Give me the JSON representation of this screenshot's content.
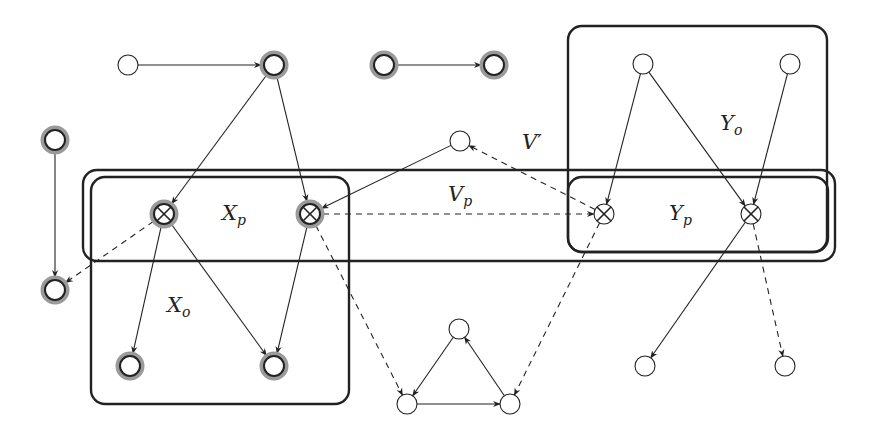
{
  "diagram": {
    "type": "directed-graph",
    "colors": {
      "stroke": "#222222",
      "halo": "#9a9a9a",
      "background": "#ffffff"
    },
    "labels": {
      "Xp": {
        "base": "X",
        "sub": "p"
      },
      "Xo": {
        "base": "X",
        "sub": "o"
      },
      "Vp": {
        "base": "V",
        "sub": "p"
      },
      "Vprime": {
        "base": "V",
        "sup": "′"
      },
      "Yo": {
        "base": "Y",
        "sub": "o"
      },
      "Yp": {
        "base": "Y",
        "sub": "p"
      }
    },
    "regions": [
      {
        "id": "V-prime-band",
        "label": "V'"
      },
      {
        "id": "Xp-box",
        "label": "Xp"
      },
      {
        "id": "Xo-box",
        "label": "Xo"
      },
      {
        "id": "Yo-box",
        "label": "Yo"
      },
      {
        "id": "Yp-box",
        "label": "Yp"
      }
    ],
    "nodes": [
      {
        "id": "n1",
        "x": 128,
        "y": 65,
        "style": "plain"
      },
      {
        "id": "n2",
        "x": 274,
        "y": 65,
        "style": "halo"
      },
      {
        "id": "n3",
        "x": 384,
        "y": 65,
        "style": "halo"
      },
      {
        "id": "n4",
        "x": 494,
        "y": 65,
        "style": "halo"
      },
      {
        "id": "n5",
        "x": 55,
        "y": 140,
        "style": "halo"
      },
      {
        "id": "n6",
        "x": 55,
        "y": 290,
        "style": "halo"
      },
      {
        "id": "xp1",
        "x": 164,
        "y": 214,
        "style": "halo-cross"
      },
      {
        "id": "xp2",
        "x": 310,
        "y": 214,
        "style": "halo-cross"
      },
      {
        "id": "xo1",
        "x": 130,
        "y": 366,
        "style": "halo"
      },
      {
        "id": "xo2",
        "x": 274,
        "y": 366,
        "style": "halo"
      },
      {
        "id": "v1",
        "x": 460,
        "y": 141,
        "style": "plain"
      },
      {
        "id": "yo1",
        "x": 643,
        "y": 64,
        "style": "plain"
      },
      {
        "id": "yo2",
        "x": 790,
        "y": 64,
        "style": "plain"
      },
      {
        "id": "yp1",
        "x": 604,
        "y": 214,
        "style": "cross"
      },
      {
        "id": "yp2",
        "x": 751,
        "y": 214,
        "style": "cross"
      },
      {
        "id": "t1",
        "x": 459,
        "y": 329,
        "style": "plain"
      },
      {
        "id": "t2",
        "x": 407,
        "y": 404,
        "style": "plain"
      },
      {
        "id": "t3",
        "x": 510,
        "y": 404,
        "style": "plain"
      },
      {
        "id": "b1",
        "x": 645,
        "y": 366,
        "style": "plain"
      },
      {
        "id": "b2",
        "x": 785,
        "y": 366,
        "style": "plain"
      }
    ],
    "edges": [
      {
        "from": "n1",
        "to": "n2",
        "style": "solid"
      },
      {
        "from": "n3",
        "to": "n4",
        "style": "solid"
      },
      {
        "from": "n2",
        "to": "xp1",
        "style": "solid"
      },
      {
        "from": "n2",
        "to": "xp2",
        "style": "solid"
      },
      {
        "from": "n5",
        "to": "n6",
        "style": "solid"
      },
      {
        "from": "xp1",
        "to": "n6",
        "style": "dashed"
      },
      {
        "from": "xp1",
        "to": "xo1",
        "style": "solid"
      },
      {
        "from": "xp1",
        "to": "xo2",
        "style": "solid"
      },
      {
        "from": "xp2",
        "to": "xo2",
        "style": "solid"
      },
      {
        "from": "v1",
        "to": "xp2",
        "style": "solid"
      },
      {
        "from": "xp2",
        "to": "yp1",
        "style": "dashed"
      },
      {
        "from": "yp1",
        "to": "v1",
        "style": "dashed"
      },
      {
        "from": "xp2",
        "to": "t2",
        "style": "dashed"
      },
      {
        "from": "yp1",
        "to": "t3",
        "style": "dashed"
      },
      {
        "from": "yo1",
        "to": "yp1",
        "style": "solid"
      },
      {
        "from": "yo1",
        "to": "yp2",
        "style": "solid"
      },
      {
        "from": "yo2",
        "to": "yp2",
        "style": "solid"
      },
      {
        "from": "yp2",
        "to": "b1",
        "style": "solid"
      },
      {
        "from": "yp2",
        "to": "b2",
        "style": "dashed"
      },
      {
        "from": "t1",
        "to": "t2",
        "style": "solid"
      },
      {
        "from": "t2",
        "to": "t3",
        "style": "solid"
      },
      {
        "from": "t3",
        "to": "t1",
        "style": "solid"
      }
    ]
  }
}
